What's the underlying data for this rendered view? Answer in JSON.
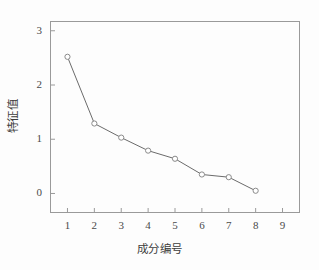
{
  "chart_data": {
    "type": "line",
    "title": "",
    "subtitle": "",
    "xlabel": "成分编号",
    "ylabel": "特征值",
    "x": [
      1,
      2,
      3,
      4,
      5,
      6,
      7,
      8
    ],
    "values": [
      2.52,
      1.29,
      1.03,
      0.79,
      0.64,
      0.35,
      0.3,
      0.05
    ],
    "series": [
      {
        "name": "特征值",
        "values": [
          2.52,
          1.29,
          1.03,
          0.79,
          0.64,
          0.35,
          0.3,
          0.05
        ]
      }
    ],
    "xlim": [
      0.35,
      9.65
    ],
    "ylim": [
      -0.36,
      3.18
    ],
    "xticks": [
      1,
      2,
      3,
      4,
      5,
      6,
      7,
      8,
      9
    ],
    "xtick_labels": [
      "1",
      "2",
      "3",
      "4",
      "5",
      "6",
      "7",
      "8",
      "9"
    ],
    "yticks": [
      0,
      1,
      2,
      3
    ],
    "ytick_labels": [
      "0",
      "1",
      "2",
      "3"
    ],
    "grid": false,
    "legend": null,
    "marker": "open-circle",
    "line_color": "#6b6b6b",
    "marker_color": "#8a8a8a",
    "frame_color": "#9a9a9a",
    "background": "#ffffff"
  }
}
